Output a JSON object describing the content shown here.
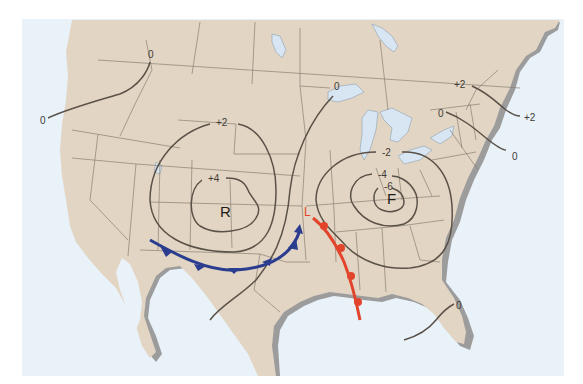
{
  "map": {
    "title": "Weather map of North America",
    "colors": {
      "page_bg": "#ffffff",
      "water": "#e9f2f9",
      "land": "#e2d5c3",
      "coast_shadow": "#9a9a9a",
      "isobar": "#5a5148",
      "cold_front": "#2b3d8f",
      "warm_front": "#e2452b",
      "lakes": "#d8e6f3"
    },
    "pressure_centers": [
      {
        "id": "R",
        "label": "R"
      },
      {
        "id": "F",
        "label": "F"
      }
    ],
    "low_marker": {
      "label": "L"
    },
    "isolines": [
      {
        "id": "west-zero",
        "labels": [
          "0",
          "0"
        ]
      },
      {
        "id": "r-plus2",
        "label": "+2"
      },
      {
        "id": "r-plus4",
        "label": "+4"
      },
      {
        "id": "mid-zero",
        "label": "0"
      },
      {
        "id": "f-minus2",
        "label": "-2"
      },
      {
        "id": "f-minus4",
        "label": "-4"
      },
      {
        "id": "f-minus6",
        "label": "-6"
      },
      {
        "id": "ne-plus2",
        "labels": [
          "+2",
          "+2"
        ]
      },
      {
        "id": "ne-zero",
        "labels": [
          "0",
          "0"
        ]
      },
      {
        "id": "fl-zero",
        "label": "0"
      }
    ],
    "fronts": [
      {
        "id": "cold-front",
        "type": "cold",
        "color": "#2b3d8f"
      },
      {
        "id": "warm-front",
        "type": "warm",
        "color": "#e2452b"
      }
    ]
  }
}
